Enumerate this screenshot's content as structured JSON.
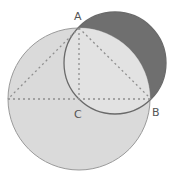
{
  "diagram": {
    "points": {
      "A": {
        "label": "A",
        "x": 79,
        "y": 28
      },
      "B": {
        "label": "B",
        "x": 151,
        "y": 99
      },
      "C": {
        "label": "C",
        "x": 79,
        "y": 99
      }
    },
    "big_circle": {
      "center": "C",
      "cx": 79,
      "cy": 99,
      "r": 71,
      "fill": "#d9d9d9",
      "stroke": "#8a8a8a"
    },
    "small_circle": {
      "cx": 115,
      "cy": 63,
      "r": 51,
      "fill": "#6f6f6f",
      "stroke": "#6a6a6a"
    },
    "dashed_color": "#8f8f8f"
  }
}
